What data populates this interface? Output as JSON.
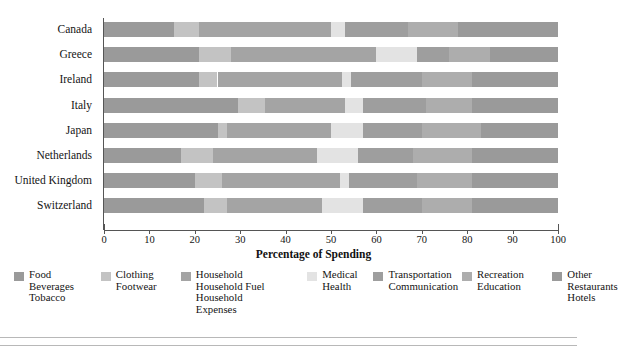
{
  "chart_data": {
    "type": "bar",
    "orientation": "horizontal",
    "stacked": true,
    "title": "",
    "xlabel": "Percentage of Spending",
    "ylabel": "",
    "xlim": [
      0,
      100
    ],
    "xticks": [
      0,
      10,
      20,
      30,
      40,
      50,
      60,
      70,
      80,
      90,
      100
    ],
    "xtick_labels": [
      "0",
      "10",
      "20",
      "30",
      "40",
      "50",
      "60",
      "70",
      "80",
      "90",
      "100"
    ],
    "grid": false,
    "legend_position": "bottom",
    "categories": [
      "Canada",
      "Greece",
      "Ireland",
      "Italy",
      "Japan",
      "Netherlands",
      "United Kingdom",
      "Switzerland"
    ],
    "series": [
      {
        "name": "Food Beverages Tobacco",
        "legend_lines": [
          "Food",
          "Beverages",
          "Tobacco"
        ],
        "color": "#9a9a9a",
        "values": [
          15.5,
          21.0,
          21.0,
          29.5,
          25.0,
          17.0,
          20.0,
          22.0
        ]
      },
      {
        "name": "Clothing Footwear",
        "legend_lines": [
          "Clothing",
          "Footwear"
        ],
        "color": "#c3c3c3",
        "values": [
          5.5,
          7.0,
          4.0,
          6.0,
          2.0,
          7.0,
          6.0,
          5.0
        ]
      },
      {
        "name": "Household Household Fuel Household Expenses",
        "legend_lines": [
          "Household",
          "Household Fuel",
          "Household",
          "Expenses"
        ],
        "color": "#a4a4a4",
        "values": [
          29.0,
          32.0,
          27.5,
          17.5,
          23.0,
          23.0,
          26.0,
          21.0
        ]
      },
      {
        "name": "Medical Health",
        "legend_lines": [
          "Medical",
          "Health"
        ],
        "color": "#e3e3e3",
        "values": [
          3.0,
          9.0,
          2.0,
          4.0,
          7.0,
          9.0,
          2.0,
          9.0
        ]
      },
      {
        "name": "Transportation Communication",
        "legend_lines": [
          "Transportation",
          "Communication"
        ],
        "color": "#9e9e9e",
        "values": [
          14.0,
          7.0,
          15.5,
          14.0,
          13.0,
          12.0,
          15.0,
          13.0
        ]
      },
      {
        "name": "Recreation Education",
        "legend_lines": [
          "Recreation",
          "Education"
        ],
        "color": "#adadad",
        "values": [
          11.0,
          9.0,
          11.0,
          10.0,
          13.0,
          13.0,
          12.0,
          11.0
        ]
      },
      {
        "name": "Other Restaurants Hotels",
        "legend_lines": [
          "Other",
          "Restaurants",
          "Hotels"
        ],
        "color": "#9a9a9a",
        "values": [
          22.0,
          15.0,
          19.0,
          19.0,
          17.0,
          19.0,
          19.0,
          19.0
        ]
      }
    ]
  },
  "axis": {
    "x_title": "Percentage of Spending"
  }
}
